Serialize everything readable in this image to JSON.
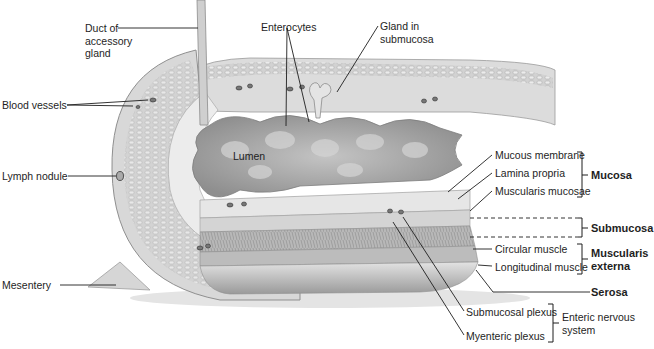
{
  "diagram": {
    "colors": {
      "background": "#ffffff",
      "tissue_light": "#d9d9d9",
      "tissue_mid": "#bdbdbd",
      "tissue_dark": "#8f8f8f",
      "lumen": "#a8a8a8",
      "leader_line": "#1e1e1e"
    },
    "labels": {
      "duct": [
        "Duct of",
        "accessory",
        "gland"
      ],
      "enterocytes": "Enterocytes",
      "gland": [
        "Gland in",
        "submucosa"
      ],
      "blood_vessels": "Blood vessels",
      "lumen": "Lumen",
      "lymph_nodule": "Lymph nodule",
      "mesentery": "Mesentery",
      "mucous_membrane": "Mucous membrane",
      "lamina_propria": "Lamina propria",
      "muscularis_mucosae": "Muscularis mucosae",
      "circular_muscle": "Circular muscle",
      "longitudinal_muscle": "Longitudinal muscle",
      "submucosal_plexus": "Submucosal plexus",
      "myenteric_plexus": "Myenteric plexus"
    },
    "groups": {
      "mucosa": "Mucosa",
      "submucosa": "Submucosa",
      "muscularis_externa": [
        "Muscularis",
        "externa"
      ],
      "serosa": "Serosa",
      "enteric_nervous_system": [
        "Enteric nervous",
        "system"
      ]
    }
  }
}
